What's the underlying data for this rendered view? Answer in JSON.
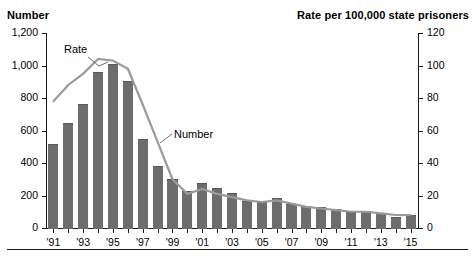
{
  "header": {
    "left_title": "Number",
    "right_title": "Rate per 100,000 state prisoners"
  },
  "annotations": {
    "rate_label": "Rate",
    "number_label": "Number"
  },
  "axes": {
    "left_ticks": [
      "1,200",
      "1,000",
      "800",
      "600",
      "400",
      "200",
      "0"
    ],
    "right_ticks": [
      "120",
      "100",
      "80",
      "60",
      "40",
      "20",
      "0"
    ],
    "x_ticks": [
      "'91",
      "'93",
      "'95",
      "'97",
      "'99",
      "'01",
      "'03",
      "'05",
      "'07",
      "'09",
      "'11",
      "'13",
      "'15"
    ]
  },
  "colors": {
    "bar": "#6d6d6d",
    "line": "#9a9a9a",
    "axis": "#1a1a1a",
    "text": "#000000"
  },
  "chart_data": {
    "type": "bar",
    "title": "",
    "xlabel": "",
    "ylabel": "Number",
    "y2label": "Rate per 100,000 state prisoners",
    "ylim": [
      0,
      1200
    ],
    "y2lim": [
      0,
      120
    ],
    "grid": false,
    "legend": "inline-annotations",
    "categories": [
      "1991",
      "1992",
      "1993",
      "1994",
      "1995",
      "1996",
      "1997",
      "1998",
      "1999",
      "2000",
      "2001",
      "2002",
      "2003",
      "2004",
      "2005",
      "2006",
      "2007",
      "2008",
      "2009",
      "2010",
      "2011",
      "2012",
      "2013",
      "2014",
      "2015"
    ],
    "tick_categories": [
      "'91",
      "'93",
      "'95",
      "'97",
      "'99",
      "'01",
      "'03",
      "'05",
      "'07",
      "'09",
      "'11",
      "'13",
      "'15"
    ],
    "series": [
      {
        "name": "Number",
        "type": "bar",
        "axis": "left",
        "units": "homicides",
        "values": [
          520,
          645,
          765,
          960,
          1010,
          905,
          545,
          380,
          300,
          230,
          275,
          245,
          215,
          165,
          160,
          185,
          150,
          135,
          130,
          120,
          100,
          105,
          90,
          70,
          80
        ]
      },
      {
        "name": "Rate",
        "type": "line",
        "axis": "right",
        "units": "per 100,000 state prisoners",
        "values": [
          78,
          88,
          95,
          104,
          103,
          98,
          76,
          53,
          30,
          21,
          24,
          21,
          19,
          17,
          16,
          17,
          15,
          13,
          12,
          11,
          10,
          10,
          9,
          8,
          8
        ]
      }
    ]
  }
}
